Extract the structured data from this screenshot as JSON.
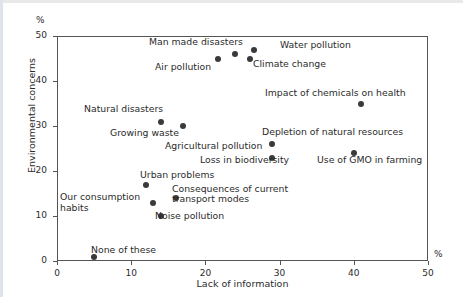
{
  "chart_data": {
    "type": "scatter",
    "title": "",
    "xlabel": "Lack of information",
    "ylabel": "Environmental concerns",
    "x_unit": "%",
    "y_unit": "%",
    "xlim": [
      0,
      50
    ],
    "ylim": [
      0,
      50
    ],
    "xticks": [
      0,
      10,
      20,
      30,
      40,
      50
    ],
    "yticks": [
      0,
      10,
      20,
      30,
      40,
      50
    ],
    "xtick_labels": [
      "0",
      "10",
      "20",
      "30",
      "40",
      "50"
    ],
    "ytick_labels": [
      "0",
      "10",
      "20",
      "30",
      "40",
      "50"
    ],
    "grid": false,
    "legend": "none",
    "marker_color": "#3a3a3a",
    "points": [
      {
        "label": "Water pollution",
        "x": 26.5,
        "y": 47
      },
      {
        "label": "Man made disasters",
        "x": 24,
        "y": 46
      },
      {
        "label": "Air pollution",
        "x": 21.7,
        "y": 45
      },
      {
        "label": "Climate change",
        "x": 26,
        "y": 45
      },
      {
        "label": "Impact of chemicals on health",
        "x": 41,
        "y": 35
      },
      {
        "label": "Natural disasters",
        "x": 14,
        "y": 31
      },
      {
        "label": "Growing waste",
        "x": 17,
        "y": 30
      },
      {
        "label": "Depletion of natural resources",
        "x": 29,
        "y": 26
      },
      {
        "label": "Use of GMO in farming",
        "x": 40,
        "y": 24
      },
      {
        "label": "Loss in biodiversity",
        "x": 29,
        "y": 23
      },
      {
        "label": "Urban problems",
        "x": 12,
        "y": 17
      },
      {
        "label": "Consequences of current transport modes",
        "x": 16,
        "y": 14
      },
      {
        "label": "Our consumption habits",
        "x": 13,
        "y": 13
      },
      {
        "label": "Noise pollution",
        "x": 14,
        "y": 10
      },
      {
        "label": "None of these",
        "x": 5,
        "y": 1
      }
    ],
    "annotations": [
      {
        "name": "water-pollution",
        "text": "Water pollution",
        "x": 280,
        "y": 40
      },
      {
        "name": "man-made-disasters",
        "text": "Man made disasters",
        "x": 149,
        "y": 37
      },
      {
        "name": "air-pollution",
        "text": "Air pollution",
        "x": 155,
        "y": 62
      },
      {
        "name": "climate-change",
        "text": "Climate change",
        "x": 253,
        "y": 59
      },
      {
        "name": "impact-chemicals",
        "text": "Impact of chemicals on health",
        "x": 265,
        "y": 88
      },
      {
        "name": "natural-disasters",
        "text": "Natural disasters",
        "x": 84,
        "y": 104
      },
      {
        "name": "growing-waste",
        "text": "Growing waste",
        "x": 110,
        "y": 128
      },
      {
        "name": "depletion-resources",
        "text": "Depletion of natural resources",
        "x": 262,
        "y": 127
      },
      {
        "name": "agricultural-pollution",
        "text": "Agricultural pollution",
        "x": 165,
        "y": 141
      },
      {
        "name": "use-of-gmo",
        "text": "Use of GMO in farming",
        "x": 317,
        "y": 155
      },
      {
        "name": "loss-in-biodiversity",
        "text": "Loss in biodiversity",
        "x": 200,
        "y": 155
      },
      {
        "name": "urban-problems",
        "text": "Urban problems",
        "x": 140,
        "y": 170
      },
      {
        "name": "consequences-transport-line1",
        "text": "Consequences of current",
        "x": 172,
        "y": 184
      },
      {
        "name": "consequences-transport-line2",
        "text": "transport modes",
        "x": 172,
        "y": 194
      },
      {
        "name": "our-consumption-line1",
        "text": "Our consumption",
        "x": 60,
        "y": 192
      },
      {
        "name": "our-consumption-line2",
        "text": "habits",
        "x": 60,
        "y": 203
      },
      {
        "name": "noise-pollution",
        "text": "Noise pollution",
        "x": 155,
        "y": 211
      },
      {
        "name": "none-of-these",
        "text": "None of these",
        "x": 91,
        "y": 245
      }
    ]
  }
}
